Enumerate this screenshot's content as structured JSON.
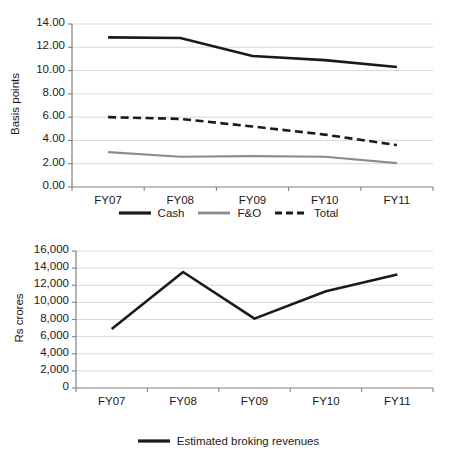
{
  "figure": {
    "background": "#ffffff",
    "text_color": "#1a1a1a",
    "gridline_color": "#d9d9d9",
    "axis_color": "#808080"
  },
  "chart_data": [
    {
      "id": "basis-points-chart",
      "type": "line",
      "title": "",
      "xlabel": "",
      "ylabel": "Basis points",
      "categories": [
        "FY07",
        "FY08",
        "FY09",
        "FY10",
        "FY11"
      ],
      "ylim": [
        0,
        14
      ],
      "ytick_step": 2,
      "ytick_labels": [
        "0.00",
        "2.00",
        "4.00",
        "6.00",
        "8.00",
        "10.00",
        "12.00",
        "14.00"
      ],
      "ytick_values": [
        0,
        2,
        4,
        6,
        8,
        10,
        12,
        14
      ],
      "grid": true,
      "grid_axis": "y",
      "legend_position": "bottom",
      "series": [
        {
          "name": "Cash",
          "values": [
            12.85,
            12.8,
            11.25,
            10.9,
            10.3
          ],
          "color": "#1a1a1a",
          "style": "solid",
          "width": 2.6
        },
        {
          "name": "F&O",
          "values": [
            3.0,
            2.6,
            2.65,
            2.6,
            2.05
          ],
          "color": "#8c8c8c",
          "style": "solid",
          "width": 2.2
        },
        {
          "name": "Total",
          "values": [
            6.0,
            5.85,
            5.2,
            4.5,
            3.6
          ],
          "color": "#1a1a1a",
          "style": "dashed",
          "width": 2.6
        }
      ]
    },
    {
      "id": "broking-revenues-chart",
      "type": "line",
      "title": "",
      "xlabel": "",
      "ylabel": "Rs crores",
      "categories": [
        "FY07",
        "FY08",
        "FY09",
        "FY10",
        "FY11"
      ],
      "ylim": [
        0,
        16000
      ],
      "ytick_step": 2000,
      "ytick_labels": [
        "0",
        "2,000",
        "4,000",
        "6,000",
        "8,000",
        "10,000",
        "12,000",
        "14,000",
        "16,000"
      ],
      "ytick_values": [
        0,
        2000,
        4000,
        6000,
        8000,
        10000,
        12000,
        14000,
        16000
      ],
      "grid": true,
      "grid_axis": "y",
      "legend_position": "bottom",
      "series": [
        {
          "name": "Estimated broking revenues",
          "values": [
            6900,
            13550,
            8100,
            11300,
            13250
          ],
          "color": "#1a1a1a",
          "style": "solid",
          "width": 2.6
        }
      ]
    }
  ]
}
